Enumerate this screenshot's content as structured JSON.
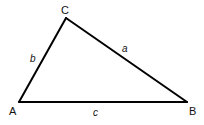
{
  "diagram": {
    "type": "triangle",
    "stroke_color": "#000000",
    "stroke_width": 2,
    "vertices": {
      "A": {
        "label": "A",
        "x": 19,
        "y": 102
      },
      "B": {
        "label": "B",
        "x": 187,
        "y": 102
      },
      "C": {
        "label": "C",
        "x": 66,
        "y": 18
      }
    },
    "vertex_labels": {
      "A": "A",
      "B": "B",
      "C": "C"
    },
    "side_labels": {
      "a": "a",
      "b": "b",
      "c": "c"
    },
    "sides": [
      {
        "name": "a",
        "from": "B",
        "to": "C",
        "label": "a"
      },
      {
        "name": "b",
        "from": "A",
        "to": "C",
        "label": "b"
      },
      {
        "name": "c",
        "from": "A",
        "to": "B",
        "label": "c"
      }
    ]
  }
}
